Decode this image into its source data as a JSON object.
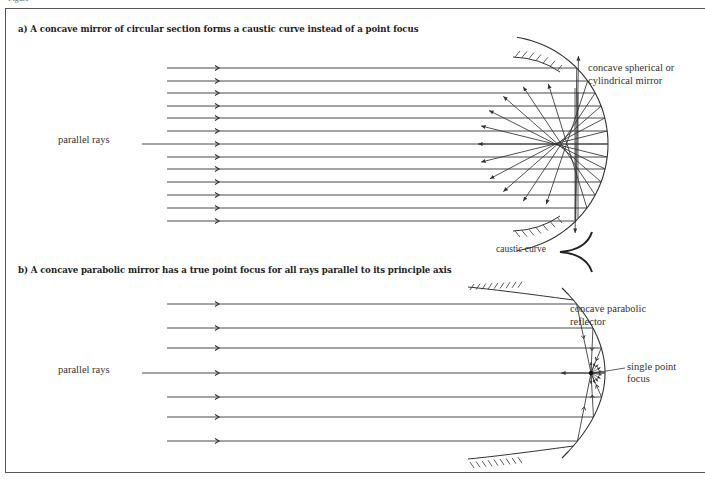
{
  "figure": {
    "fragment_text": "Figure",
    "part_a": {
      "heading": "a)  A concave mirror of circular section forms a caustic curve instead of a point focus",
      "labels": {
        "parallel_rays": "parallel rays",
        "mirror": "concave spherical or",
        "mirror_line2": "cylindrical mirror",
        "caustic": "caustic curve"
      },
      "ray_count": 13,
      "ray_y": [
        68,
        81,
        93,
        106,
        118,
        131,
        144,
        157,
        169,
        182,
        195,
        208,
        221
      ],
      "mirror_center": [
        500,
        144
      ],
      "mirror_radius": 108
    },
    "part_b": {
      "heading": "b)  A concave parabolic mirror has a true point focus for all rays parallel to its principle axis",
      "labels": {
        "parallel_rays": "parallel rays",
        "reflector": "concave parabolic",
        "reflector_line2": "reflector",
        "focus": "single point",
        "focus_line2": "focus"
      },
      "ray_count": 7,
      "ray_y": [
        304,
        328,
        348,
        373,
        397,
        417,
        441
      ],
      "vertex": [
        605,
        373
      ],
      "focal_length": 14
    },
    "colors": {
      "line": "#333333",
      "text": "#222222",
      "border": "#555555"
    }
  }
}
